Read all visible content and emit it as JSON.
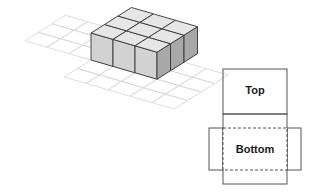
{
  "figure": {
    "block": {
      "rows": 3,
      "cols": 3,
      "layers": 1
    },
    "net": {
      "top_label": "Top",
      "bottom_label": "Bottom"
    },
    "colors": {
      "grid_line": "#dcdcdc",
      "cube_top": "#e6e6e6",
      "cube_front": "#d2d2d2",
      "cube_side": "#a8a8a8",
      "edge": "#333333",
      "net_line": "#555555"
    }
  }
}
